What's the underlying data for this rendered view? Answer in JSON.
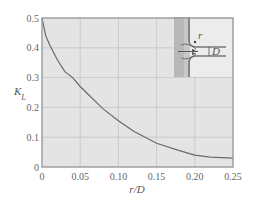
{
  "chart_data": {
    "type": "line",
    "title": "",
    "xlabel": "r/D",
    "ylabel": "K_L",
    "xlim": [
      0,
      0.25
    ],
    "ylim": [
      0,
      0.5
    ],
    "grid": true,
    "legend": null,
    "x_ticks": [
      "0",
      "0.05",
      "0.10",
      "0.15",
      "0.20",
      "0.25"
    ],
    "y_ticks": [
      "0",
      "0.1",
      "0.2",
      "0.3",
      "0.4",
      "0.5"
    ],
    "series": [
      {
        "name": "K_L vs r/D",
        "x": [
          0,
          0.005,
          0.01,
          0.02,
          0.03,
          0.04,
          0.05,
          0.06,
          0.08,
          0.1,
          0.12,
          0.15,
          0.18,
          0.2,
          0.22,
          0.25
        ],
        "y": [
          0.5,
          0.44,
          0.41,
          0.36,
          0.32,
          0.3,
          0.27,
          0.245,
          0.195,
          0.155,
          0.12,
          0.08,
          0.055,
          0.04,
          0.033,
          0.03
        ]
      }
    ],
    "annotations": [
      "Inset sketch: rounded pipe inlet with radius r and diameter D"
    ]
  },
  "colors": {
    "plot_bg": "#e4e4e4",
    "grid": "#c4c4c4",
    "frame": "#9a9a9a",
    "curve": "#6a6a6a"
  },
  "inset": {
    "r_label": "r",
    "D_label": "D"
  }
}
